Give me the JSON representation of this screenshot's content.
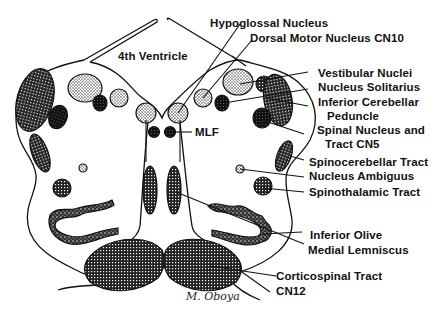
{
  "diagram": {
    "ventricle_label": "4th Ventricle",
    "labels": {
      "hypoglossal_nucleus": "Hypoglossal Nucleus",
      "dorsal_motor_nucleus": "Dorsal Motor Nucleus CN10",
      "vestibular_nuclei": "Vestibular Nuclei",
      "nucleus_solitarius": "Nucleus Solitarius",
      "inferior_cerebellar_line1": "Inferior Cerebellar",
      "inferior_cerebellar_line2": "Peduncle",
      "spinal_nucleus_line1": "Spinal Nucleus and",
      "spinal_nucleus_line2": "Tract CN5",
      "spinocerebellar_tract": "Spinocerebellar Tract",
      "nucleus_ambiguus": "Nucleus Ambiguus",
      "spinothalamic_tract": "Spinothalamic Tract",
      "inferior_olive": "Inferior Olive",
      "medial_lemniscus": "Medial Lemniscus",
      "corticospinal_tract": "Corticospinal Tract",
      "cn12": "CN12",
      "mlf": "MLF"
    },
    "signature": "M. Oboya",
    "colors": {
      "ink": "#111111",
      "background": "#ffffff"
    }
  }
}
